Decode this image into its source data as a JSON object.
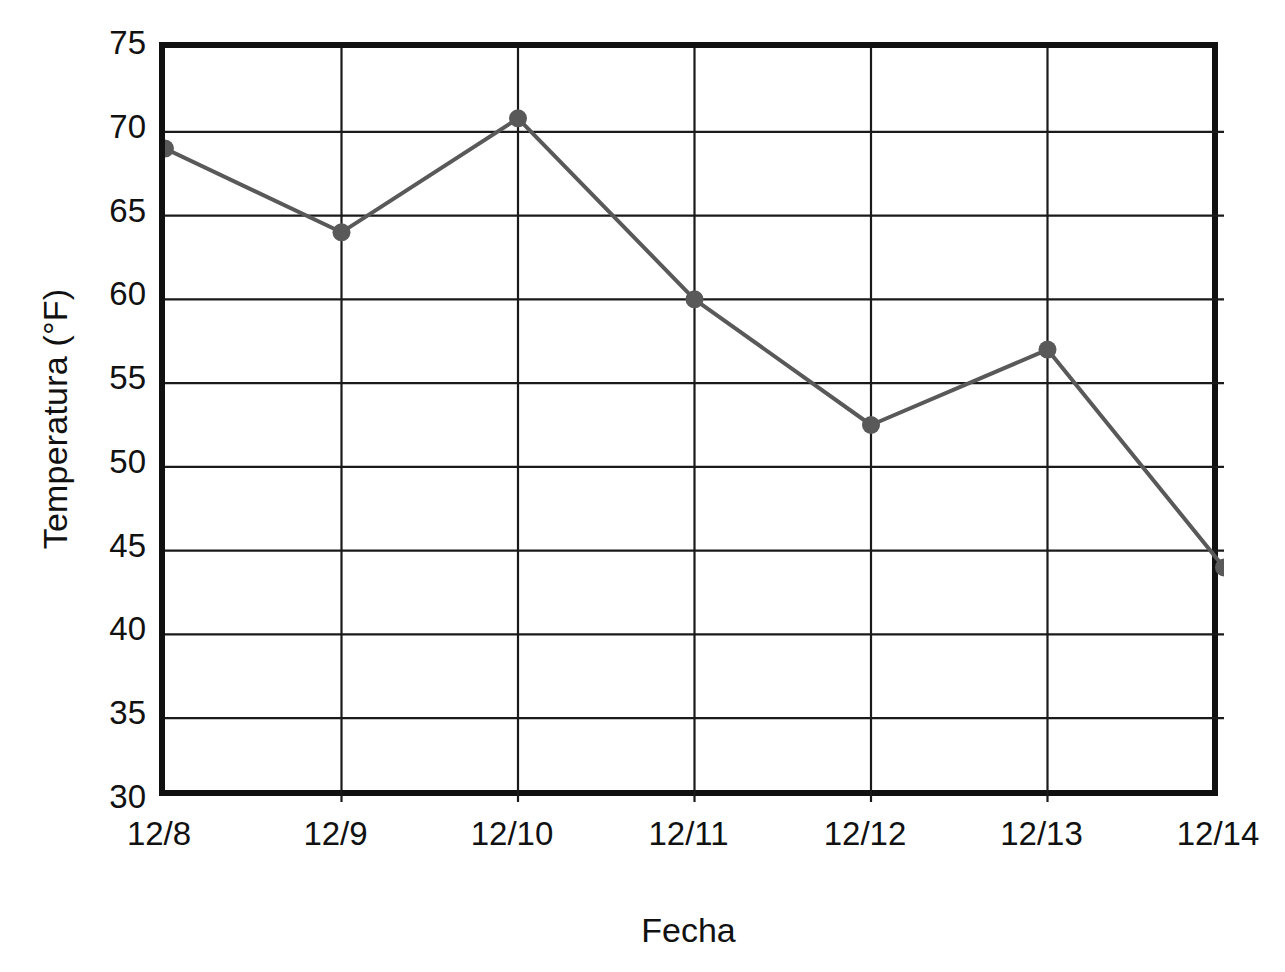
{
  "chart_data": {
    "type": "line",
    "title": "",
    "xlabel": "Fecha",
    "ylabel": "Temperatura (°F)",
    "categories": [
      "12/8",
      "12/9",
      "12/10",
      "12/11",
      "12/12",
      "12/13",
      "12/14"
    ],
    "values": [
      69,
      64,
      70.8,
      60,
      52.5,
      57,
      44
    ],
    "series": [
      {
        "name": "Temperatura",
        "values": [
          69,
          64,
          70.8,
          60,
          52.5,
          57,
          44
        ]
      }
    ],
    "ylim": [
      30,
      75
    ],
    "ytick_step": 5,
    "yticks": [
      75,
      70,
      65,
      60,
      55,
      50,
      45,
      40,
      35,
      30
    ],
    "xticks": [
      "12/8",
      "12/9",
      "12/10",
      "12/11",
      "12/12",
      "12/13",
      "12/14"
    ],
    "grid": "both",
    "legend": "none",
    "colors": {
      "line": "#595959",
      "marker": "#595959",
      "frame": "#111111",
      "gridline": "#1a1a1a",
      "background": "#ffffff",
      "text": "#111111"
    },
    "line_width": 4,
    "marker_radius": 9,
    "marker_shape": "circle"
  },
  "axes": {
    "y_title": "Temperatura (°F)",
    "x_title": "Fecha",
    "y_tick_labels": [
      "75",
      "70",
      "65",
      "60",
      "55",
      "50",
      "45",
      "40",
      "35",
      "30"
    ],
    "x_tick_labels": [
      "12/8",
      "12/9",
      "12/10",
      "12/11",
      "12/12",
      "12/13",
      "12/14"
    ]
  }
}
